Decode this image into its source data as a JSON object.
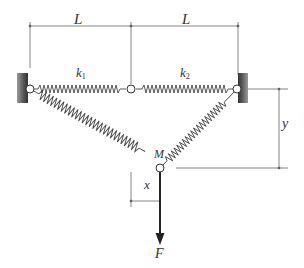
{
  "figure": {
    "labels": {
      "span_left": "L",
      "span_right": "L",
      "spring_left": "k",
      "spring_left_sub": "1",
      "spring_right": "k",
      "spring_right_sub": "2",
      "mass": "M",
      "horizontal_offset": "x",
      "vertical_offset": "y",
      "force": "F"
    },
    "colors": {
      "line": "#555555",
      "spring": "#444444",
      "wall_dark": "#444444",
      "wall_light": "#9a9a9a",
      "arrow": "#222222",
      "node_fill": "#ffffff"
    }
  }
}
